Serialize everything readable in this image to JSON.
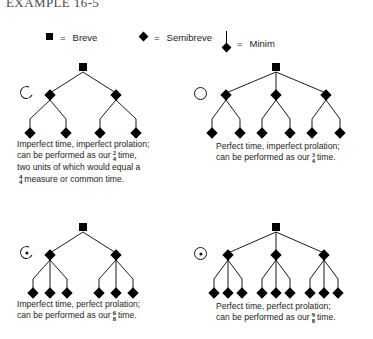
{
  "title": "EXAMPLE 16-5",
  "legend": {
    "items": [
      {
        "symbol": "breve-square",
        "equals": "=",
        "label": "Breve"
      },
      {
        "symbol": "semibreve-diamond",
        "equals": "=",
        "label": "Semibreve"
      },
      {
        "symbol": "minim-stemmed-diamond",
        "equals": "=",
        "label": "Minim"
      }
    ]
  },
  "diagrams": [
    {
      "id": "imperfect-time-imperfect-prolation",
      "sign": {
        "name": "mensuration-sign-c",
        "glyph": "C",
        "dotted": false
      },
      "tree": {
        "breves": 1,
        "semibreves": 2,
        "minims": 4,
        "minims_per_semibreve": 2
      },
      "caption_lines": [
        "Imperfect time, imperfect prolation;",
        "can be performed as our",
        "time,",
        "two units of which would equal a",
        "measure or common time."
      ],
      "time_signature": {
        "numerator": "2",
        "denominator": "4"
      },
      "second_time_signature": {
        "numerator": "4",
        "denominator": "4"
      }
    },
    {
      "id": "perfect-time-imperfect-prolation",
      "sign": {
        "name": "mensuration-sign-o",
        "glyph": "O",
        "dotted": false
      },
      "tree": {
        "breves": 1,
        "semibreves": 3,
        "minims": 6,
        "minims_per_semibreve": 2
      },
      "caption_lines": [
        "Perfect time, imperfect prolation;",
        "can be performed as our",
        "time."
      ],
      "time_signature": {
        "numerator": "3",
        "denominator": "4"
      }
    },
    {
      "id": "imperfect-time-perfect-prolation",
      "sign": {
        "name": "mensuration-sign-c-dotted",
        "glyph": "C",
        "dotted": true
      },
      "tree": {
        "breves": 1,
        "semibreves": 2,
        "minims": 6,
        "minims_per_semibreve": 3
      },
      "caption_lines": [
        "Imperfect time, perfect prolation;",
        "can be performed as our",
        "time."
      ],
      "time_signature": {
        "numerator": "6",
        "denominator": "8"
      }
    },
    {
      "id": "perfect-time-perfect-prolation",
      "sign": {
        "name": "mensuration-sign-o-dotted",
        "glyph": "O",
        "dotted": true
      },
      "tree": {
        "breves": 1,
        "semibreves": 3,
        "minims": 9,
        "minims_per_semibreve": 3
      },
      "caption_lines": [
        "Perfect time, perfect prolation;",
        "can be performed as our",
        "time."
      ],
      "time_signature": {
        "numerator": "9",
        "denominator": "8"
      }
    }
  ],
  "colors": {
    "ink": "#000000",
    "text": "#1d1d1d",
    "background": "#ffffff"
  }
}
